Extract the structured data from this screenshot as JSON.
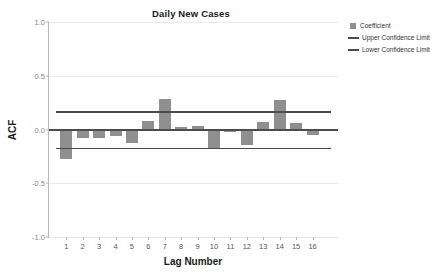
{
  "chart_data": {
    "type": "bar",
    "title": "Daily New Cases",
    "xlabel": "Lag Number",
    "ylabel": "ACF",
    "categories": [
      "1",
      "2",
      "3",
      "4",
      "5",
      "6",
      "7",
      "8",
      "9",
      "10",
      "11",
      "12",
      "13",
      "14",
      "15",
      "16"
    ],
    "values": [
      -0.27,
      -0.08,
      -0.08,
      -0.06,
      -0.13,
      0.08,
      0.28,
      0.02,
      0.03,
      -0.18,
      -0.02,
      -0.14,
      0.07,
      0.27,
      0.06,
      -0.05
    ],
    "series": [
      {
        "name": "Coefficient",
        "values": [
          -0.27,
          -0.08,
          -0.08,
          -0.06,
          -0.13,
          0.08,
          0.28,
          0.02,
          0.03,
          -0.18,
          -0.02,
          -0.14,
          0.07,
          0.27,
          0.06,
          -0.05
        ]
      }
    ],
    "upper_confidence_limit": 0.17,
    "lower_confidence_limit": -0.17,
    "ylim": [
      -1.0,
      1.0
    ],
    "yticks": [
      1.0,
      0.5,
      0.0,
      -0.5,
      -1.0
    ],
    "ytick_labels": [
      "1.0",
      "0.5",
      "0.0",
      "-0.5",
      "-1.0"
    ],
    "grid": true,
    "legend_position": "top-right",
    "legend": [
      {
        "label": "Coefficient",
        "marker": "square-swatch",
        "color": "#8f8f8f"
      },
      {
        "label": "Upper Confidence Limit",
        "marker": "line-swatch",
        "color": "#4a4a4a"
      },
      {
        "label": "Lower Confidence Limit",
        "marker": "line-swatch",
        "color": "#4a4a4a"
      }
    ]
  }
}
